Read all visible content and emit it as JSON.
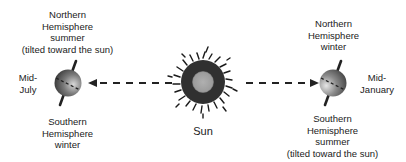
{
  "diagram": {
    "sun": {
      "label": "Sun",
      "core_color": "#a8a8a8",
      "ray_color": "#1a1a1a"
    },
    "left_earth": {
      "date_label": [
        "Mid-",
        "July"
      ],
      "top_label": [
        "Northern",
        "Hemisphere",
        "summer",
        "(tilted toward the sun)"
      ],
      "bottom_label": [
        "Southern",
        "Hemisphere",
        "winter"
      ]
    },
    "right_earth": {
      "date_label": [
        "Mid-",
        "January"
      ],
      "top_label": [
        "Northern",
        "Hemisphere",
        "winter"
      ],
      "bottom_label": [
        "Southern",
        "Hemisphere",
        "summer",
        "(tilted toward the sun)"
      ]
    },
    "arrows": [
      {
        "direction": "left",
        "from": "sun",
        "to": "left_earth"
      },
      {
        "direction": "right",
        "from": "sun",
        "to": "right_earth"
      }
    ]
  }
}
